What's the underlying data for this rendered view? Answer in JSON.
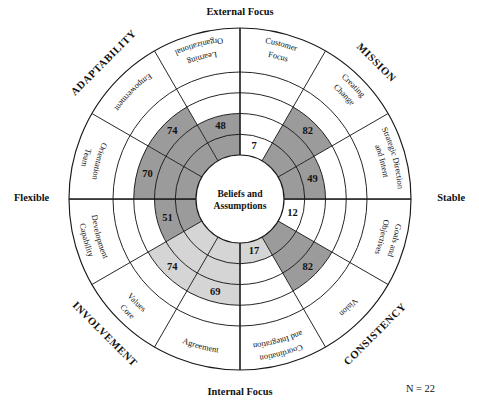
{
  "figure": {
    "center_label_line1": "Beliefs and",
    "center_label_line2": "Assumptions",
    "sample_note": "N = 22",
    "colors": {
      "fill_dark": "#9b9b9b",
      "fill_light": "#d5d5d5",
      "fill_empty": "#ffffff",
      "stroke": "#1a1a1a",
      "text": "#111111"
    }
  },
  "axes": {
    "top": "External Focus",
    "bottom": "Internal Focus",
    "left": "Flexible",
    "right": "Stable"
  },
  "quadrants": [
    {
      "id": "adaptability",
      "label": "ADAPTABILITY"
    },
    {
      "id": "mission",
      "label": "MISSION"
    },
    {
      "id": "consistency",
      "label": "CONSISTENCY"
    },
    {
      "id": "involvement",
      "label": "INVOLVEMENT"
    }
  ],
  "chart_data": {
    "type": "pie",
    "subtitle": "Beliefs and Assumptions",
    "xlabel": "",
    "ylabel": "Percentile score",
    "ylim": [
      0,
      100
    ],
    "rings": 4,
    "grid": true,
    "legend": "none",
    "annotations": [
      "N = 22"
    ],
    "axis_labels": {
      "top": "External Focus",
      "bottom": "Internal Focus",
      "left": "Flexible",
      "right": "Stable"
    },
    "categories": [
      "Organizational Learning",
      "Customer Focus",
      "Creating Change",
      "Strategic Direction and Intent",
      "Goals and Objectives",
      "Vision",
      "Coordination and Integration",
      "Agreement",
      "Core Values",
      "Capability Development",
      "Team Orientation",
      "Empowerment"
    ],
    "values": [
      48,
      7,
      82,
      49,
      12,
      82,
      17,
      69,
      74,
      51,
      70,
      74
    ],
    "series": [
      {
        "name": "Percentile score",
        "values": [
          48,
          7,
          82,
          49,
          12,
          82,
          17,
          69,
          74,
          51,
          70,
          74
        ]
      }
    ],
    "segments": [
      {
        "quadrant": "ADAPTABILITY",
        "label_line1": "Organizational",
        "label_line2": "Learning",
        "value": 48,
        "shade": "dark"
      },
      {
        "quadrant": "ADAPTABILITY",
        "label_line1": "Customer",
        "label_line2": "Focus",
        "value": 7,
        "shade": "dark"
      },
      {
        "quadrant": "ADAPTABILITY",
        "label_line1": "Creating",
        "label_line2": "Change",
        "value": 82,
        "shade": "dark"
      },
      {
        "quadrant": "MISSION",
        "label_line1": "Strategic Direction",
        "label_line2": "and Intent",
        "value": 49,
        "shade": "dark"
      },
      {
        "quadrant": "MISSION",
        "label_line1": "Goals and",
        "label_line2": "Objectives",
        "value": 12,
        "shade": "dark"
      },
      {
        "quadrant": "MISSION",
        "label_line1": "Vision",
        "label_line2": "",
        "value": 82,
        "shade": "dark"
      },
      {
        "quadrant": "CONSISTENCY",
        "label_line1": "Coordination",
        "label_line2": "and Integration",
        "value": 17,
        "shade": "light"
      },
      {
        "quadrant": "CONSISTENCY",
        "label_line1": "Agreement",
        "label_line2": "",
        "value": 69,
        "shade": "light"
      },
      {
        "quadrant": "CONSISTENCY",
        "label_line1": "Core",
        "label_line2": "Values",
        "value": 74,
        "shade": "light"
      },
      {
        "quadrant": "INVOLVEMENT",
        "label_line1": "Capability",
        "label_line2": "Development",
        "value": 51,
        "shade": "dark"
      },
      {
        "quadrant": "INVOLVEMENT",
        "label_line1": "Team",
        "label_line2": "Orientation",
        "value": 70,
        "shade": "dark"
      },
      {
        "quadrant": "INVOLVEMENT",
        "label_line1": "Empowerment",
        "label_line2": "",
        "value": 74,
        "shade": "dark"
      }
    ]
  }
}
